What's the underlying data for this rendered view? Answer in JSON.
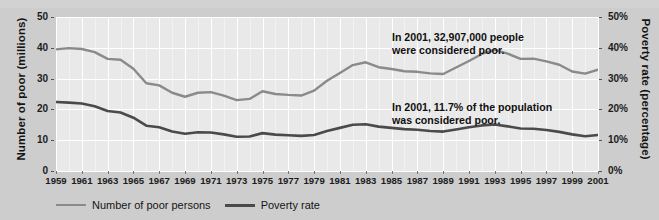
{
  "chart_data": {
    "type": "line",
    "title": "",
    "xlabel": "",
    "ylabel": "Number of poor (millions)",
    "ylabel_right": "Poverty rate (percentage)",
    "ylim": [
      0,
      50
    ],
    "ylim_right": [
      0,
      50
    ],
    "grid": true,
    "legend_position": "bottom-left",
    "x": [
      1959,
      1960,
      1961,
      1962,
      1963,
      1964,
      1965,
      1966,
      1967,
      1968,
      1969,
      1970,
      1971,
      1972,
      1973,
      1974,
      1975,
      1976,
      1977,
      1978,
      1979,
      1980,
      1981,
      1982,
      1983,
      1984,
      1985,
      1986,
      1987,
      1988,
      1989,
      1990,
      1991,
      1992,
      1993,
      1994,
      1995,
      1996,
      1997,
      1998,
      1999,
      2000,
      2001
    ],
    "xticks": [
      1959,
      1961,
      1963,
      1965,
      1967,
      1969,
      1971,
      1973,
      1975,
      1977,
      1979,
      1981,
      1983,
      1985,
      1987,
      1989,
      1991,
      1993,
      1995,
      1997,
      1999,
      2001
    ],
    "yticks_left": [
      0,
      10,
      20,
      30,
      40,
      50
    ],
    "ytick_labels_left": [
      "0",
      "10",
      "20",
      "30",
      "40",
      "50"
    ],
    "yticks_right": [
      0,
      10,
      20,
      30,
      40,
      50
    ],
    "ytick_labels_right": [
      "0%",
      "10%",
      "20%",
      "30%",
      "40%",
      "50%"
    ],
    "series": [
      {
        "name": "Number of poor persons",
        "axis": "left",
        "units": "millions",
        "color": "#8a8a8a",
        "values": [
          39.5,
          39.9,
          39.6,
          38.6,
          36.4,
          36.1,
          33.2,
          28.5,
          27.8,
          25.4,
          24.1,
          25.4,
          25.6,
          24.5,
          23.0,
          23.4,
          25.9,
          25.0,
          24.7,
          24.5,
          26.1,
          29.3,
          31.8,
          34.4,
          35.3,
          33.7,
          33.1,
          32.4,
          32.2,
          31.7,
          31.5,
          33.6,
          35.7,
          38.0,
          39.3,
          38.1,
          36.4,
          36.5,
          35.6,
          34.5,
          32.3,
          31.6,
          32.9
        ]
      },
      {
        "name": "Poverty rate",
        "axis": "right",
        "units": "percent",
        "color": "#4a4a4a",
        "values": [
          22.4,
          22.2,
          21.9,
          21.0,
          19.5,
          19.0,
          17.3,
          14.7,
          14.2,
          12.8,
          12.1,
          12.6,
          12.5,
          11.9,
          11.1,
          11.2,
          12.3,
          11.8,
          11.6,
          11.4,
          11.7,
          13.0,
          14.0,
          15.0,
          15.2,
          14.4,
          14.0,
          13.6,
          13.4,
          13.0,
          12.8,
          13.5,
          14.2,
          14.8,
          15.1,
          14.5,
          13.8,
          13.7,
          13.3,
          12.7,
          11.9,
          11.3,
          11.7
        ]
      }
    ],
    "annotations": [
      {
        "id": "count",
        "text": "In 2001, 32,907,000 people\nwere considered poor.",
        "x": 1994,
        "y": 44
      },
      {
        "id": "rate",
        "text": "In 2001, 11.7% of the population\nwas considered poor.",
        "x": 1994,
        "y": 21
      }
    ]
  },
  "legend": {
    "items": [
      {
        "label": "Number of poor persons",
        "swatch": "count"
      },
      {
        "label": "Poverty rate",
        "swatch": "rate"
      }
    ]
  },
  "colors": {
    "count_line": "#8a8a8a",
    "rate_line": "#4a4a4a",
    "plot_background": "#e9e9e9",
    "figure_background": "#cdcdcd",
    "gridline": "#ffffff",
    "text": "#141414"
  }
}
